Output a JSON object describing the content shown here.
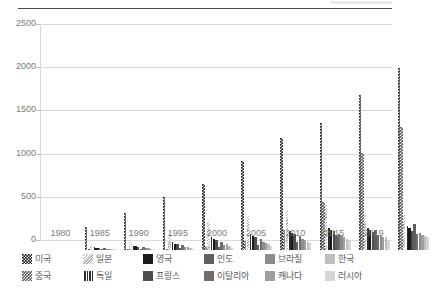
{
  "chart_data": {
    "type": "bar",
    "title": "",
    "subtitle": "",
    "xlabel": "",
    "ylabel": "",
    "ylim": [
      0,
      2500
    ],
    "yticks": [
      0,
      500,
      1000,
      1500,
      2000,
      2500
    ],
    "grid": true,
    "legend_position": "bottom",
    "legend_rows": 2,
    "legend_columns": 6,
    "categories": [
      "1980",
      "1985",
      "1990",
      "1995",
      "2000",
      "2005",
      "2010",
      "2015",
      "2019"
    ],
    "series": [
      {
        "name": "미국",
        "pattern": "checkered-dark",
        "color": "#262626",
        "values": [
          267,
          430,
          610,
          760,
          1035,
          1300,
          1475,
          1790,
          2110
        ]
      },
      {
        "name": "중국",
        "pattern": "checkered-gray",
        "color": "#595959",
        "values": [
          3,
          8,
          16,
          34,
          107,
          230,
          560,
          1120,
          1420
        ]
      },
      {
        "name": "일본",
        "pattern": "diagonal-stripe-light",
        "color": "#e0e0e0",
        "values": [
          47,
          96,
          180,
          320,
          390,
          455,
          520,
          410,
          400
        ]
      },
      {
        "name": "독일",
        "pattern": "vertical-stripe-dark",
        "color": "#3f3f3f",
        "values": [
          30,
          52,
          90,
          148,
          180,
          215,
          255,
          260,
          280
        ]
      },
      {
        "name": "영국",
        "pattern": "solid",
        "color": "#1a1a1a",
        "values": [
          27,
          44,
          75,
          125,
          160,
          200,
          235,
          235,
          250
        ]
      },
      {
        "name": "프랑스",
        "pattern": "solid",
        "color": "#4d4d4d",
        "values": [
          25,
          40,
          70,
          118,
          150,
          190,
          215,
          210,
          225
        ]
      },
      {
        "name": "인도",
        "pattern": "solid",
        "color": "#5f5f5f",
        "values": [
          8,
          12,
          20,
          36,
          58,
          95,
          175,
          235,
          300
        ]
      },
      {
        "name": "이탈리아",
        "pattern": "solid",
        "color": "#6e6e6e",
        "values": [
          20,
          33,
          58,
          98,
          125,
          158,
          180,
          170,
          185
        ]
      },
      {
        "name": "브라질",
        "pattern": "solid",
        "color": "#8c8c8c",
        "values": [
          12,
          20,
          32,
          60,
          88,
          125,
          165,
          165,
          195
        ]
      },
      {
        "name": "캐나다",
        "pattern": "solid",
        "color": "#9e9e9e",
        "values": [
          14,
          22,
          38,
          65,
          85,
          115,
          150,
          155,
          175
        ]
      },
      {
        "name": "한국",
        "pattern": "solid",
        "color": "#bfbfbf",
        "values": [
          4,
          8,
          18,
          42,
          65,
          95,
          130,
          145,
          165
        ]
      },
      {
        "name": "러시아",
        "pattern": "solid",
        "color": "#d6d6d6",
        "values": [
          3,
          6,
          10,
          22,
          42,
          78,
          120,
          120,
          150
        ]
      }
    ]
  },
  "axes": {
    "y_tick_labels": [
      "0",
      "500",
      "1000",
      "1500",
      "2000",
      "2500"
    ],
    "x_tick_labels": [
      "1980",
      "1985",
      "1990",
      "1995",
      "2000",
      "2005",
      "2010",
      "2015",
      "2019"
    ]
  },
  "colors": {
    "grid": "#d9d9d9",
    "axis_text": "#7a7a7a",
    "legend_text": "#5a5a5a",
    "top_rule": "#4a4a4a",
    "background": "#ffffff"
  }
}
